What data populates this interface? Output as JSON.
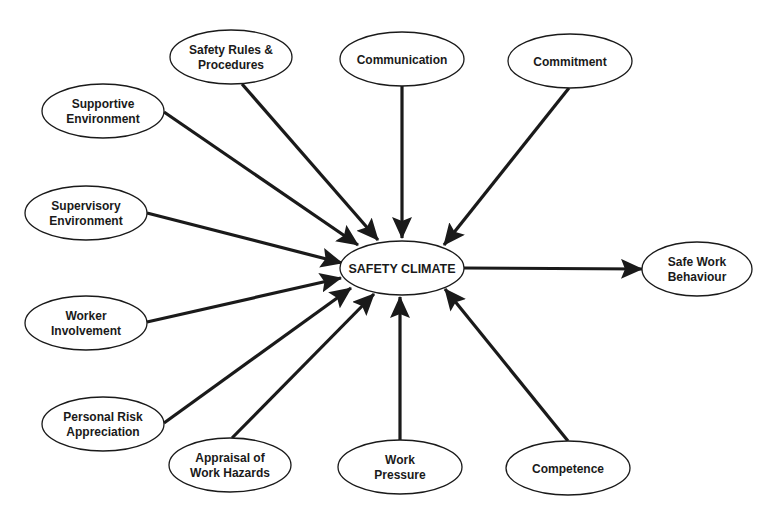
{
  "diagram": {
    "title_fragment": "cut-off title text at top edge (illegible)",
    "colors": {
      "stroke": "#1a1a1a",
      "background": "#ffffff",
      "ellipse_fill": "#ffffff"
    },
    "center": {
      "id": "safety-climate",
      "label": "SAFETY CLIMATE",
      "cx": 402,
      "cy": 268,
      "rx": 62,
      "ry": 27
    },
    "outcome": {
      "id": "safe-work-behaviour",
      "lines": [
        "Safe Work",
        "Behaviour"
      ],
      "cx": 697,
      "cy": 269,
      "rx": 55,
      "ry": 27
    },
    "inputs": [
      {
        "id": "safety-rules-procedures",
        "lines": [
          "Safety Rules &",
          "Procedures"
        ],
        "cx": 231,
        "cy": 57,
        "rx": 61,
        "ry": 27,
        "arrow_from": [
          242,
          84
        ],
        "arrow_to": [
          378,
          240
        ]
      },
      {
        "id": "communication",
        "lines": [
          "Communication"
        ],
        "cx": 402,
        "cy": 59,
        "rx": 62,
        "ry": 27,
        "arrow_from": [
          402,
          86
        ],
        "arrow_to": [
          402,
          238
        ]
      },
      {
        "id": "commitment",
        "lines": [
          "Commitment"
        ],
        "cx": 570,
        "cy": 61,
        "rx": 62,
        "ry": 27,
        "arrow_from": [
          569,
          88
        ],
        "arrow_to": [
          444,
          245
        ]
      },
      {
        "id": "supportive-environment",
        "lines": [
          "Supportive",
          "Environment"
        ],
        "cx": 103,
        "cy": 111,
        "rx": 61,
        "ry": 27,
        "arrow_from": [
          164,
          112
        ],
        "arrow_to": [
          358,
          245
        ]
      },
      {
        "id": "supervisory-environment",
        "lines": [
          "Supervisory",
          "Environment"
        ],
        "cx": 86,
        "cy": 213,
        "rx": 61,
        "ry": 27,
        "arrow_from": [
          147,
          213
        ],
        "arrow_to": [
          342,
          263
        ]
      },
      {
        "id": "worker-involvement",
        "lines": [
          "Worker",
          "Involvement"
        ],
        "cx": 86,
        "cy": 323,
        "rx": 61,
        "ry": 27,
        "arrow_from": [
          147,
          322
        ],
        "arrow_to": [
          341,
          278
        ]
      },
      {
        "id": "personal-risk-appreciation",
        "lines": [
          "Personal Risk",
          "Appreciation"
        ],
        "cx": 103,
        "cy": 424,
        "rx": 61,
        "ry": 27,
        "arrow_from": [
          164,
          423
        ],
        "arrow_to": [
          351,
          288
        ]
      },
      {
        "id": "appraisal-of-work-hazards",
        "lines": [
          "Appraisal of",
          "Work Hazards"
        ],
        "cx": 230,
        "cy": 465,
        "rx": 61,
        "ry": 27,
        "arrow_from": [
          232,
          438
        ],
        "arrow_to": [
          374,
          294
        ]
      },
      {
        "id": "work-pressure",
        "lines": [
          "Work",
          "Pressure"
        ],
        "cx": 400,
        "cy": 467,
        "rx": 62,
        "ry": 27,
        "arrow_from": [
          400,
          440
        ],
        "arrow_to": [
          400,
          297
        ]
      },
      {
        "id": "competence",
        "lines": [
          "Competence"
        ],
        "cx": 568,
        "cy": 468,
        "rx": 62,
        "ry": 27,
        "arrow_from": [
          568,
          441
        ],
        "arrow_to": [
          445,
          289
        ]
      }
    ],
    "output_arrow": {
      "from": [
        464,
        268
      ],
      "to": [
        642,
        269
      ]
    }
  }
}
